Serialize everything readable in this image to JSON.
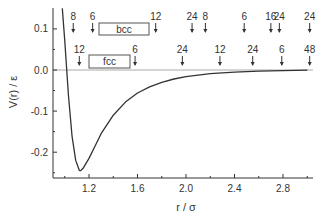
{
  "chart_data": {
    "type": "line",
    "title": "",
    "xlabel": "r / σ",
    "ylabel": "V(r) / ε",
    "xlim": [
      0.9,
      3.05
    ],
    "ylim": [
      -0.26,
      0.15
    ],
    "grid": false,
    "xticks": [
      "1.2",
      "1.6",
      "2.0",
      "2.4",
      "2.8"
    ],
    "xtick_values": [
      1.2,
      1.6,
      2.0,
      2.4,
      2.8
    ],
    "yticks": [
      "0.1",
      "0.0",
      "-0.1",
      "-0.2"
    ],
    "ytick_values": [
      0.1,
      0.0,
      -0.1,
      -0.2
    ],
    "series": [
      {
        "name": "V(r)",
        "description": "Interatomic pair potential with minimum near r=1.13, V=-0.245",
        "x": [
          0.98,
          1.0,
          1.03,
          1.06,
          1.09,
          1.12,
          1.13,
          1.15,
          1.2,
          1.25,
          1.3,
          1.4,
          1.5,
          1.6,
          1.7,
          1.8,
          1.9,
          2.0,
          2.2,
          2.4,
          2.6,
          2.8,
          3.0
        ],
        "y": [
          0.15,
          0.07,
          -0.06,
          -0.16,
          -0.22,
          -0.244,
          -0.245,
          -0.24,
          -0.215,
          -0.185,
          -0.155,
          -0.11,
          -0.078,
          -0.056,
          -0.041,
          -0.03,
          -0.022,
          -0.016,
          -0.009,
          -0.005,
          -0.003,
          -0.0015,
          -0.0005
        ]
      }
    ],
    "reference_line": {
      "y": 0.0,
      "color": "#aaaaaa"
    },
    "annotations": {
      "bcc": {
        "label": "bcc",
        "shells": [
          {
            "count": "8",
            "r": 1.07
          },
          {
            "count": "6",
            "r": 1.23
          },
          {
            "count": "12",
            "r": 1.75
          },
          {
            "count": "24",
            "r": 2.05
          },
          {
            "count": "8",
            "r": 2.16
          },
          {
            "count": "6",
            "r": 2.48
          },
          {
            "count": "16",
            "r": 2.7
          },
          {
            "count": "24",
            "r": 2.77
          },
          {
            "count": "24",
            "r": 3.02
          }
        ]
      },
      "fcc": {
        "label": "fcc",
        "shells": [
          {
            "count": "12",
            "r": 1.12
          },
          {
            "count": "6",
            "r": 1.58
          },
          {
            "count": "24",
            "r": 1.97
          },
          {
            "count": "12",
            "r": 2.28
          },
          {
            "count": "24",
            "r": 2.55
          },
          {
            "count": "6",
            "r": 2.79
          },
          {
            "count": "48",
            "r": 3.02
          }
        ]
      }
    }
  }
}
